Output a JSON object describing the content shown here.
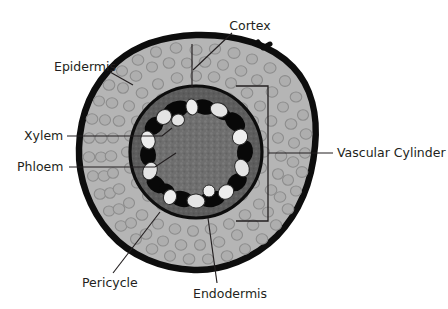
{
  "figure": {
    "background_color": "#ffffff"
  },
  "labels": [
    {
      "id": "cortex",
      "text": "Cortex",
      "x": 250,
      "y": 26,
      "anchor": "middle",
      "leader": "M 232 33 L 193 70"
    },
    {
      "id": "epidermis",
      "text": "Epidermis",
      "x": 54,
      "y": 67,
      "anchor": "start",
      "leader": "M 110 72 L 133 85"
    },
    {
      "id": "xylem",
      "text": "Xylem",
      "x": 24,
      "y": 136,
      "anchor": "start",
      "leader": "M 67 136 L 162 136 L 172 128"
    },
    {
      "id": "phloem",
      "text": "Phloem",
      "x": 17,
      "y": 167,
      "anchor": "start",
      "leader": "M 69 167 L 155 167 L 176 153"
    },
    {
      "id": "vascular-cylinder",
      "text": "Vascular Cylinder",
      "x": 337,
      "y": 153,
      "anchor": "start",
      "leader": "M 333 153 L 268 153"
    },
    {
      "id": "pericycle",
      "text": "Pericycle",
      "x": 82,
      "y": 283,
      "anchor": "start",
      "leader": "M 113 273 L 160 212"
    },
    {
      "id": "endodermis",
      "text": "Endodermis",
      "x": 193,
      "y": 294,
      "anchor": "start",
      "leader": "M 217 283 L 208 218"
    }
  ],
  "bracket": {
    "id": "vascular-cylinder-bracket",
    "path": "M 236 86 L 268 86 L 268 221 L 236 221"
  },
  "cortex_guide": {
    "id": "cortex-guide-line",
    "path": "M 192 44 L 192 88"
  },
  "structures": [
    {
      "id": "epidermis-ring",
      "name": "epidermis",
      "color": "#0d0d0d"
    },
    {
      "id": "cortex-region",
      "name": "cortex",
      "color": "#b5b5b5"
    },
    {
      "id": "cortex-cell",
      "name": "cortex-cell",
      "color": "#a8a8a8"
    },
    {
      "id": "endodermis-ring",
      "name": "endodermis",
      "color": "#585858"
    },
    {
      "id": "pericycle-ring",
      "name": "pericycle",
      "color": "#6e6e6e"
    },
    {
      "id": "pith-region",
      "name": "pith",
      "color": "#6b6b6b"
    },
    {
      "id": "xylem-blob",
      "name": "xylem",
      "color": "#e8e8e8"
    },
    {
      "id": "phloem-blob",
      "name": "phloem",
      "color": "#0a0a0a"
    }
  ],
  "colors": {
    "outline": "#0d0d0d",
    "cortex_fill": "#b5b5b5",
    "cortex_cell_stroke": "#8e8e8e",
    "cortex_cell_fill": "#aeaeae",
    "stele_fill": "#5b5b5b",
    "pith_fill": "#6e6e6e",
    "xylem_fill": "#e9e9e9",
    "phloem_fill": "#080808",
    "label_text": "#231f20"
  },
  "geometry": {
    "root_center_x": 196,
    "root_center_y": 152,
    "root_radius_x": 118,
    "root_radius_y": 117,
    "stele_center_x": 196,
    "stele_center_y": 152,
    "stele_radius": 67,
    "pith_radius": 52,
    "vascular_ring_radius": 43
  }
}
